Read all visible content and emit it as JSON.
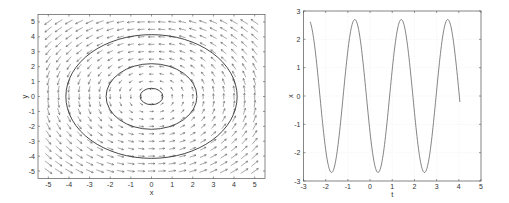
{
  "chart_data": [
    {
      "type": "quiver",
      "title": "",
      "xlabel": "x",
      "ylabel": "y",
      "xlim": [
        -5.5,
        5.5
      ],
      "ylim": [
        -5.5,
        5.5
      ],
      "xticks": [
        -5,
        -4,
        -3,
        -2,
        -1,
        0,
        1,
        2,
        3,
        4,
        5
      ],
      "yticks": [
        -5,
        -4,
        -3,
        -2,
        -1,
        0,
        1,
        2,
        3,
        4,
        5
      ],
      "grid": true,
      "vector_field": {
        "expression": "(-y, x)",
        "x_range": [
          -5,
          5
        ],
        "y_range": [
          -5,
          5
        ],
        "step": 0.5,
        "color": "#555555"
      },
      "trajectories": [
        {
          "name": "orbit-inner",
          "shape": "circle",
          "center": [
            0,
            0
          ],
          "radius": 0.55,
          "color": "#333333"
        },
        {
          "name": "orbit-middle",
          "shape": "circle",
          "center": [
            0,
            0
          ],
          "radius": 2.2,
          "color": "#333333"
        },
        {
          "name": "orbit-outer",
          "shape": "circle",
          "center": [
            0,
            0
          ],
          "radius": 4.15,
          "color": "#333333"
        }
      ]
    },
    {
      "type": "line",
      "title": "",
      "xlabel": "t",
      "ylabel": "x",
      "xlim": [
        -3,
        5
      ],
      "ylim": [
        -3,
        3
      ],
      "xticks": [
        -3,
        -2,
        -1,
        0,
        1,
        2,
        3,
        4,
        5
      ],
      "yticks": [
        -3,
        -2,
        -1,
        0,
        1,
        2,
        3
      ],
      "grid": true,
      "series": [
        {
          "name": "x(t)",
          "color": "#666666",
          "t_range": [
            -2.7,
            4.05
          ],
          "model": "amplitude*cos(omega*(t - t_peak))",
          "amplitude": 2.7,
          "omega": 3.0,
          "t_peak": 3.5,
          "peaks_t": [
            -0.6,
            1.45,
            3.5
          ],
          "troughs_t": [
            -1.7,
            0.4,
            2.45
          ]
        }
      ]
    }
  ]
}
